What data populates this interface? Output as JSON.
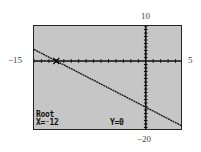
{
  "window_labels": {
    "ymax": "10",
    "ymin": "−20",
    "xmin": "−15",
    "xmax": "5"
  },
  "screen": {
    "mode": "Root",
    "x_readout": "X=⁻12",
    "y_readout": "Y=0",
    "background": "#c6c6c6"
  },
  "chart_data": {
    "type": "line",
    "title": "",
    "xlabel": "",
    "ylabel": "",
    "xlim": [
      -15,
      5
    ],
    "ylim": [
      -20,
      10
    ],
    "x_tick_step": 1,
    "y_tick_step": 1,
    "grid": false,
    "series": [
      {
        "name": "Y1",
        "x": [
          -15,
          -12,
          0,
          5
        ],
        "y": [
          3.3,
          0,
          -13.2,
          -18.7
        ]
      }
    ],
    "annotations": [
      {
        "text": "Root",
        "x": -12,
        "y": 0
      },
      {
        "text": "X=-12",
        "position": "bottom-left"
      },
      {
        "text": "Y=0",
        "position": "bottom-center"
      }
    ]
  }
}
